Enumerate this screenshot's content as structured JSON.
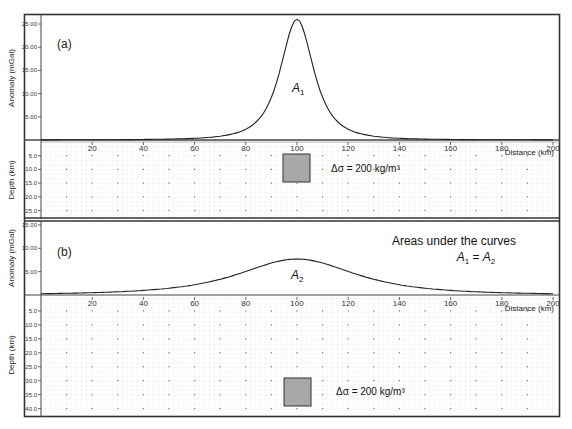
{
  "panels": [
    {
      "id": "a",
      "label": "(a)",
      "anomaly_axis_label": "Anomaly (mGal)",
      "anomaly_ticks": [
        "25.00",
        "20.00",
        "15.00",
        "10.00",
        "5.00"
      ],
      "depth_axis_label": "Depth (km)",
      "depth_ticks": [
        "5.0",
        "10.0",
        "15.0",
        "20.0",
        "25.0"
      ],
      "curve_label": "A",
      "curve_label_sub": "1",
      "body_annotation": "Δσ = 200 kg/m³",
      "distance_label": "Distance (km)"
    },
    {
      "id": "b",
      "label": "(b)",
      "anomaly_axis_label": "Anomaly (mGal)",
      "anomaly_ticks": [
        "15.00",
        "10.00",
        "5.00"
      ],
      "depth_axis_label": "Depth (km)",
      "depth_ticks": [
        "5.0",
        "10.0",
        "15.0",
        "20.0",
        "25.0",
        "30.0",
        "35.0",
        "40.0"
      ],
      "curve_label": "A",
      "curve_label_sub": "2",
      "body_annotation": "Δσ = 200 kg/m³",
      "distance_label": "Distance (km)",
      "note_line1": "Areas under the curves",
      "note_A": "A",
      "note_sub1": "1",
      "note_eq": " = ",
      "note_sub2": "2"
    }
  ],
  "x_ticks": [
    "20",
    "40",
    "60",
    "80",
    "100",
    "120",
    "140",
    "160",
    "180",
    "200"
  ],
  "chart_data": [
    {
      "type": "line",
      "title": "(a) Gravity anomaly of shallow body",
      "xlabel": "Distance (km)",
      "ylabel": "Anomaly (mGal)",
      "xlim": [
        0,
        200
      ],
      "ylim": [
        0,
        27
      ],
      "x": [
        0,
        20,
        40,
        60,
        80,
        90,
        95,
        100,
        105,
        110,
        120,
        140,
        160,
        180,
        200
      ],
      "y": [
        0.3,
        0.5,
        0.9,
        1.9,
        6.0,
        14.5,
        22.0,
        26.0,
        22.0,
        14.5,
        6.0,
        1.9,
        0.9,
        0.5,
        0.3
      ],
      "body": {
        "center_km": 100,
        "depth_top_km": 5,
        "depth_bottom_km": 15,
        "width_km": 10,
        "density_contrast": "200 kg/m³"
      }
    },
    {
      "type": "line",
      "title": "(b) Gravity anomaly of deep body",
      "xlabel": "Distance (km)",
      "ylabel": "Anomaly (mGal)",
      "xlim": [
        0,
        200
      ],
      "ylim": [
        0,
        15
      ],
      "x": [
        0,
        20,
        40,
        60,
        80,
        90,
        100,
        110,
        120,
        140,
        160,
        180,
        200
      ],
      "y": [
        1.2,
        1.8,
        2.9,
        4.6,
        6.7,
        7.5,
        7.7,
        7.5,
        6.7,
        4.6,
        2.9,
        1.8,
        1.2
      ],
      "body": {
        "center_km": 100,
        "depth_top_km": 30,
        "depth_bottom_km": 40,
        "width_km": 10,
        "density_contrast": "200 kg/m³"
      }
    }
  ]
}
